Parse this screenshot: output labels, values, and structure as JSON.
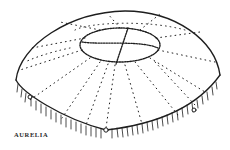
{
  "illustration": {
    "subject": "jellyfish-bell",
    "caption": "AURELIA",
    "ink_color": "#1e1e1e",
    "paper_color": "#ffffff"
  }
}
